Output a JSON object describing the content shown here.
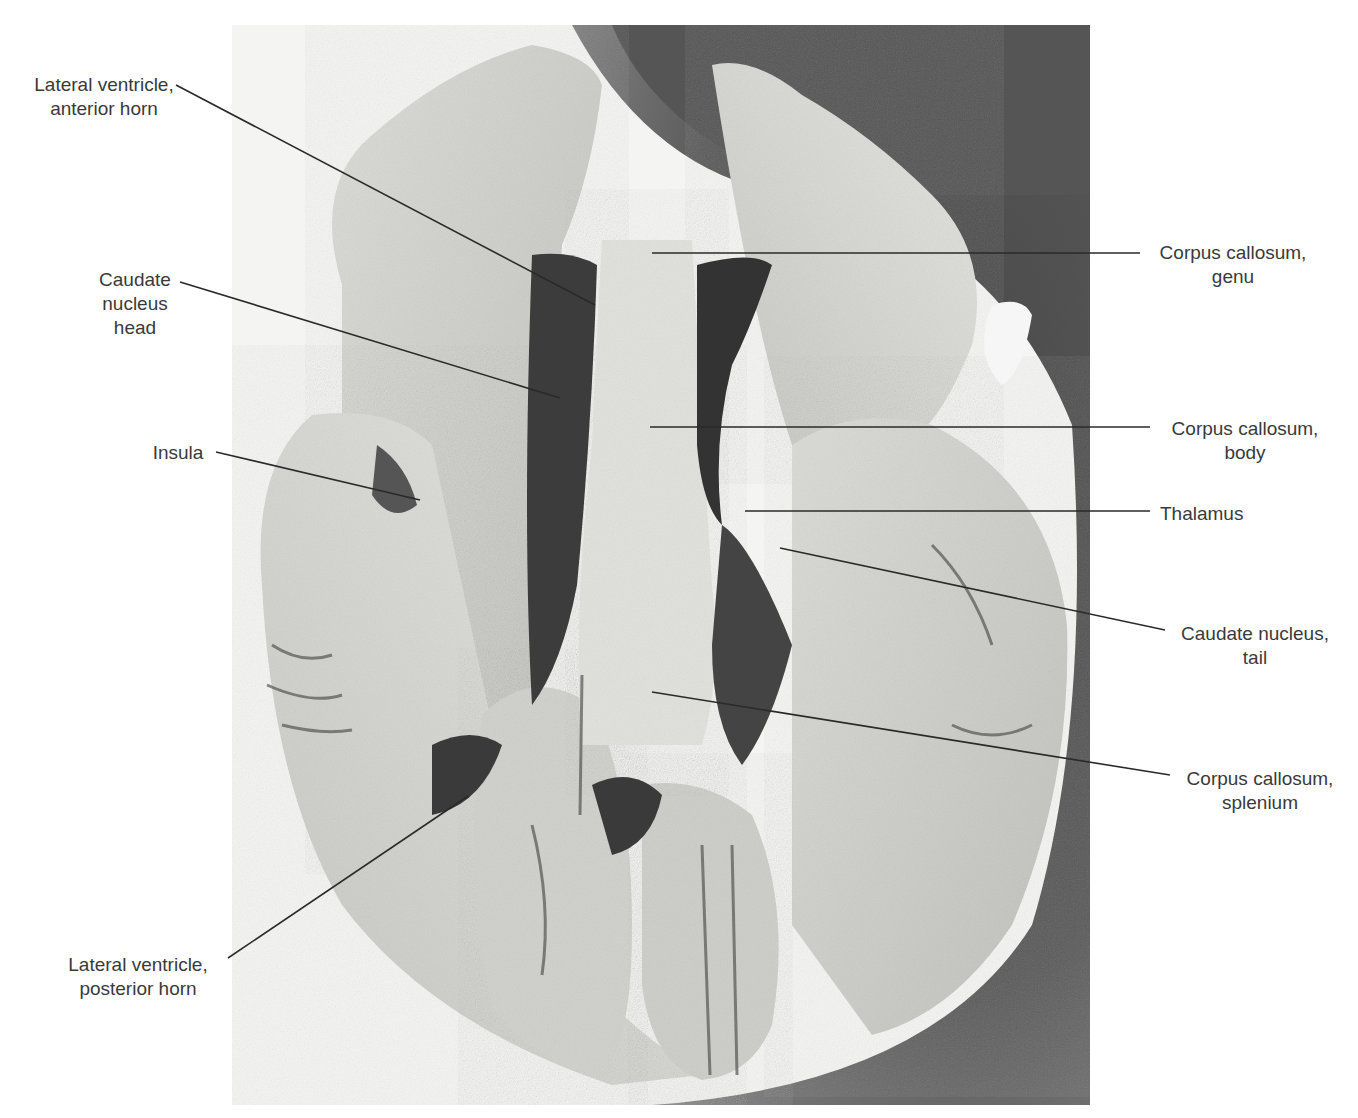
{
  "figure": {
    "type": "labeled anatomical photograph",
    "labels": [
      {
        "id": "lv-anterior",
        "lines": [
          "Lateral ventricle,",
          "anterior horn"
        ]
      },
      {
        "id": "caudate-head",
        "lines": [
          "Caudate",
          "nucleus",
          "head"
        ]
      },
      {
        "id": "insula",
        "lines": [
          "Insula"
        ]
      },
      {
        "id": "lv-posterior",
        "lines": [
          "Lateral ventricle,",
          "posterior horn"
        ]
      },
      {
        "id": "cc-genu",
        "lines": [
          "Corpus callosum,",
          "genu"
        ]
      },
      {
        "id": "cc-body",
        "lines": [
          "Corpus callosum,",
          "body"
        ]
      },
      {
        "id": "thalamus",
        "lines": [
          "Thalamus"
        ]
      },
      {
        "id": "caudate-tail",
        "lines": [
          "Caudate nucleus,",
          "tail"
        ]
      },
      {
        "id": "cc-splenium",
        "lines": [
          "Corpus callosum,",
          "splenium"
        ]
      }
    ]
  },
  "colors": {
    "background": "#ffffff",
    "label_text": "#3a3a3a",
    "leader_line": "#2a2a2a",
    "tissue_light": "#d9d9d6",
    "tissue_mid": "#bdbdb9",
    "shadow_dark": "#3c3c3c"
  }
}
